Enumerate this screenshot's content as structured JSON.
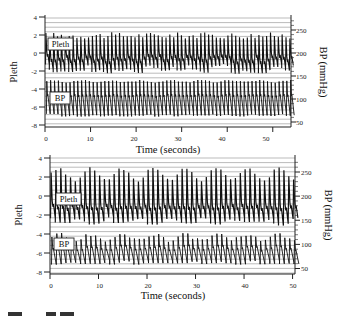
{
  "chart_data": [
    {
      "type": "line",
      "title": "",
      "panel": "top",
      "xlabel": "Time (seconds)",
      "ylabel": "Pleth",
      "y2label": "BP (mmHg)",
      "xlim": [
        0,
        54
      ],
      "ylim": [
        -8,
        4
      ],
      "y2lim": [
        45,
        270
      ],
      "xticks": [
        0,
        10,
        20,
        30,
        40,
        50
      ],
      "yticks": [
        4,
        2,
        0,
        -2,
        -4,
        -6,
        -8
      ],
      "y2ticks": [
        250,
        200,
        150,
        100,
        50
      ],
      "grid": "horizontal lines",
      "legend": [
        "Pleth",
        "BP"
      ],
      "series": [
        {
          "name": "Pleth",
          "axis": "left",
          "beat_period_s": 0.85,
          "peak_range": [
            1.6,
            2.3
          ],
          "trough_range": [
            -2.3,
            -1.2
          ],
          "description": "regular pulsatile waveform, nearly constant amplitude, peaks ~2, troughs ~-2"
        },
        {
          "name": "BP",
          "axis": "right",
          "beat_period_s": 0.85,
          "peak_range_mmHg": [
            135,
            142
          ],
          "trough_range_mmHg": [
            62,
            68
          ],
          "description": "regular arterial pressure waveform, systolic ~140, diastolic ~65 mmHg"
        }
      ]
    },
    {
      "type": "line",
      "title": "",
      "panel": "bottom",
      "xlabel": "Time (seconds)",
      "ylabel": "Pleth",
      "y2label": "BP (mmHg)",
      "xlim": [
        0,
        50.5
      ],
      "ylim": [
        -8,
        4
      ],
      "y2lim": [
        45,
        270
      ],
      "xticks": [
        0,
        10,
        20,
        30,
        40,
        50
      ],
      "yticks": [
        4,
        2,
        0,
        -2,
        -4,
        -6,
        -8
      ],
      "y2ticks": [
        250,
        200,
        150,
        100,
        50
      ],
      "grid": "horizontal lines",
      "legend": [
        "Pleth",
        "BP"
      ],
      "series": [
        {
          "name": "Pleth",
          "axis": "left",
          "beat_period_s": 1.0,
          "peak_range": [
            1.5,
            3.1
          ],
          "trough_range": [
            -3.5,
            -1.8
          ],
          "description": "pulsatile waveform with respiratory amplitude modulation (~6-7 s cycle), peaks 1.5-3, troughs -1.8 to -3.4"
        },
        {
          "name": "BP",
          "axis": "right",
          "beat_period_s": 1.0,
          "peak_range_mmHg": [
            105,
            125
          ],
          "trough_range_mmHg": [
            58,
            66
          ],
          "description": "arterial pressure waveform with mild respiratory variation, systolic ~105-125, diastolic ~60 mmHg"
        }
      ]
    }
  ],
  "panels": {
    "top": {
      "ylabel": "Pleth",
      "y2label": "BP (mmHg)",
      "xlabel": "Time (seconds)",
      "legend_pleth": "Pleth",
      "legend_bp": "BP",
      "yticks": [
        "4",
        "2",
        "0",
        "-2",
        "-4",
        "-6",
        "-8"
      ],
      "y2ticks": [
        "250",
        "200",
        "150",
        "100",
        "50"
      ],
      "xticks": [
        "0",
        "10",
        "20",
        "30",
        "40",
        "50"
      ]
    },
    "bottom": {
      "ylabel": "Pleth",
      "y2label": "BP (mmHg)",
      "xlabel": "Time (seconds)",
      "legend_pleth": "Pleth",
      "legend_bp": "BP",
      "yticks": [
        "4",
        "2",
        "0",
        "-2",
        "-4",
        "-6",
        "-8"
      ],
      "y2ticks": [
        "250",
        "200",
        "150",
        "100",
        "50"
      ],
      "xticks": [
        "0",
        "10",
        "20",
        "30",
        "40",
        "50"
      ]
    }
  },
  "colors": {
    "trace": "#111111",
    "grid": "#555555",
    "axis": "#222222",
    "background": "#ffffff"
  }
}
